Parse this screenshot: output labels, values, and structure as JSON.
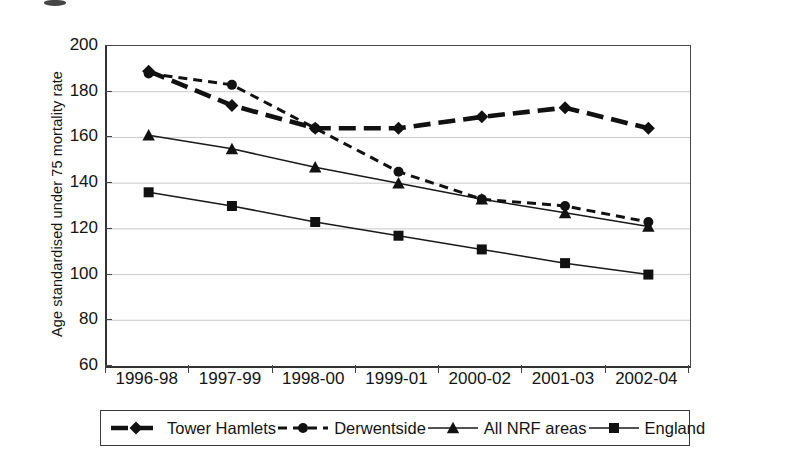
{
  "figure": {
    "caption_remnant": "",
    "background_color": "#ffffff",
    "ink_color": "#111111"
  },
  "chart_data": {
    "type": "line",
    "title": "",
    "xlabel": "",
    "ylabel": "Age standardised under 75 mortality rate",
    "categories": [
      "1996-98",
      "1997-99",
      "1998-00",
      "1999-01",
      "2000-02",
      "2001-03",
      "2002-04"
    ],
    "ylim": [
      60,
      200
    ],
    "yticks": [
      60,
      80,
      100,
      120,
      140,
      160,
      180,
      200
    ],
    "ytick_labels": [
      "60",
      "80",
      "100",
      "120",
      "140",
      "160",
      "180",
      "200"
    ],
    "grid": true,
    "grid_axis": "y",
    "legend_position": "below",
    "series": [
      {
        "name": "Tower Hamlets",
        "marker": "diamond",
        "line_style": "thick-dashed",
        "values": [
          189,
          174,
          164,
          164,
          169,
          173,
          164
        ]
      },
      {
        "name": "Derwentside",
        "marker": "circle",
        "line_style": "fine-dotted",
        "values": [
          188,
          183,
          164,
          145,
          133,
          130,
          123
        ]
      },
      {
        "name": "All NRF areas",
        "marker": "triangle",
        "line_style": "solid",
        "values": [
          161,
          155,
          147,
          140,
          133,
          127,
          121
        ]
      },
      {
        "name": "England",
        "marker": "square",
        "line_style": "solid",
        "values": [
          136,
          130,
          123,
          117,
          111,
          105,
          100
        ]
      }
    ]
  }
}
